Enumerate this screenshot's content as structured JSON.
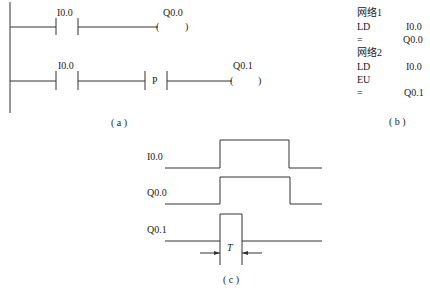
{
  "ladder": {
    "rung1": {
      "contact_label": "I0.0",
      "coil_label": "Q0.0",
      "coil_symbol_open": "(",
      "coil_symbol_close": ")"
    },
    "rung2": {
      "contact_label": "I0.0",
      "edge_label": "P",
      "coil_label": "Q0.1",
      "coil_symbol_open": "(",
      "coil_symbol_close": ")"
    },
    "caption": "( a )"
  },
  "stl": {
    "lines": [
      {
        "op": "网络1",
        "arg": ""
      },
      {
        "op": "LD",
        "arg": "I0.0"
      },
      {
        "op": "=",
        "arg": "Q0.0"
      },
      {
        "op": "网络2",
        "arg": ""
      },
      {
        "op": "LD",
        "arg": "I0.0"
      },
      {
        "op": "EU",
        "arg": ""
      },
      {
        "op": "=",
        "arg": "Q0.1"
      }
    ],
    "caption": "( b )"
  },
  "timing": {
    "signals": [
      {
        "name": "I0.0"
      },
      {
        "name": "Q0.0"
      },
      {
        "name": "Q0.1"
      }
    ],
    "pulse_width_label": "T",
    "caption": "( c )"
  },
  "colors": {
    "line": "#333333",
    "text": "#222222",
    "background": "#ffffff"
  }
}
